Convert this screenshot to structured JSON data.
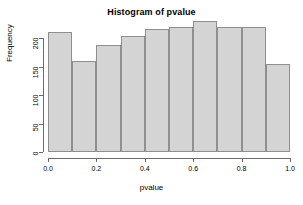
{
  "chart_data": {
    "type": "bar",
    "title": "Histogram of pvalue",
    "xlabel": "pvalue",
    "ylabel": "Frequency",
    "categories": [
      "0.0-0.1",
      "0.1-0.2",
      "0.2-0.3",
      "0.3-0.4",
      "0.4-0.5",
      "0.5-0.6",
      "0.6-0.7",
      "0.7-0.8",
      "0.8-0.9",
      "0.9-1.0"
    ],
    "bin_edges": [
      0.0,
      0.1,
      0.2,
      0.3,
      0.4,
      0.5,
      0.6,
      0.7,
      0.8,
      0.9,
      1.0
    ],
    "values": [
      211,
      159,
      188,
      203,
      215,
      220,
      229,
      219,
      220,
      155
    ],
    "xlim": [
      0.0,
      1.0
    ],
    "ylim": [
      0,
      229
    ],
    "y_axis_max_tick": 200,
    "xticks": [
      0.0,
      0.2,
      0.4,
      0.6,
      0.8,
      1.0
    ],
    "xtick_labels": [
      "0.0",
      "0.2",
      "0.4",
      "0.6",
      "0.8",
      "1.0"
    ],
    "yticks": [
      0,
      50,
      100,
      150,
      200
    ],
    "ytick_labels": [
      "0",
      "50",
      "100",
      "150",
      "200"
    ],
    "grid": false,
    "legend": null,
    "bar_fill_color": "#d4d4d4",
    "bar_border_color": "#8f8f8f",
    "axis_color": "#6a6a6a",
    "text_color": "#000000",
    "background_color": "#ffffff"
  }
}
